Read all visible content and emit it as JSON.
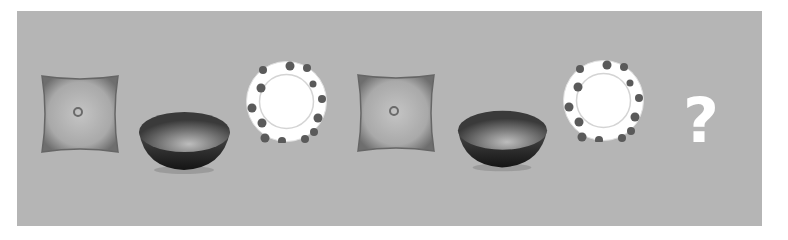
{
  "puzzle": {
    "type": "pattern-sequence",
    "sequence": [
      {
        "object": "pillow-icon",
        "label": "pillow"
      },
      {
        "object": "bowl-icon",
        "label": "bowl"
      },
      {
        "object": "plate-icon",
        "label": "polka-dot plate"
      },
      {
        "object": "pillow-icon",
        "label": "pillow"
      },
      {
        "object": "bowl-icon",
        "label": "bowl"
      },
      {
        "object": "plate-icon",
        "label": "polka-dot plate"
      }
    ],
    "unknown_symbol": "?",
    "colors": {
      "panel_background": "#b5b5b5",
      "pillow": "#a8a8a8",
      "bowl": "#3a3a3a",
      "plate_dots": "#5a5a5a",
      "plate_rim": "#ffffff",
      "question_mark": "#ffffff"
    }
  }
}
